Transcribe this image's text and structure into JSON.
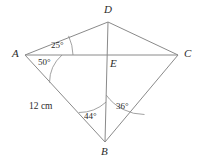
{
  "figure": {
    "type": "geometry-diagram",
    "shape": "quadrilateral-kite-with-diagonals",
    "background_color": "#ffffff",
    "stroke_color": "#8a8a8a",
    "text_color": "#2b2b2b",
    "vertices": [
      {
        "name": "A",
        "label": "A",
        "x": 25,
        "y": 55,
        "label_x": 12,
        "label_y": 49
      },
      {
        "name": "D",
        "label": "D",
        "x": 108,
        "y": 22,
        "label_x": 104,
        "label_y": 5
      },
      {
        "name": "C",
        "label": "C",
        "x": 178,
        "y": 55,
        "label_x": 184,
        "label_y": 49
      },
      {
        "name": "B",
        "label": "B",
        "x": 105,
        "y": 142,
        "label_x": 101,
        "label_y": 147
      },
      {
        "name": "E",
        "label": "E",
        "x": 107,
        "y": 55,
        "label_x": 110,
        "label_y": 58
      }
    ],
    "edges": [
      {
        "name": "edge-AD",
        "from": "A",
        "to": "D"
      },
      {
        "name": "edge-DC",
        "from": "D",
        "to": "C"
      },
      {
        "name": "edge-CB",
        "from": "C",
        "to": "B"
      },
      {
        "name": "edge-BA",
        "from": "B",
        "to": "A"
      }
    ],
    "diagonals": [
      {
        "name": "diagonal-AC",
        "from": "A",
        "to": "C"
      },
      {
        "name": "diagonal-DB",
        "from": "D",
        "to": "B"
      }
    ],
    "angles": [
      {
        "name": "angle-DAC",
        "label": "25°",
        "vertex": "A",
        "value": 25,
        "unit": "degrees",
        "label_x": 51,
        "label_y": 42
      },
      {
        "name": "angle-CAB",
        "label": "50°",
        "vertex": "A",
        "value": 50,
        "unit": "degrees",
        "label_x": 38,
        "label_y": 58
      },
      {
        "name": "angle-ABD",
        "label": "44°",
        "vertex": "B",
        "value": 44,
        "unit": "degrees",
        "label_x": 84,
        "label_y": 112
      },
      {
        "name": "angle-DBC",
        "label": "36°",
        "vertex": "B",
        "value": 36,
        "unit": "degrees",
        "label_x": 115,
        "label_y": 102
      }
    ],
    "side_labels": [
      {
        "name": "side-label-AB",
        "label": "12 cm",
        "edge": "BA",
        "x": 29,
        "y": 103
      }
    ]
  }
}
